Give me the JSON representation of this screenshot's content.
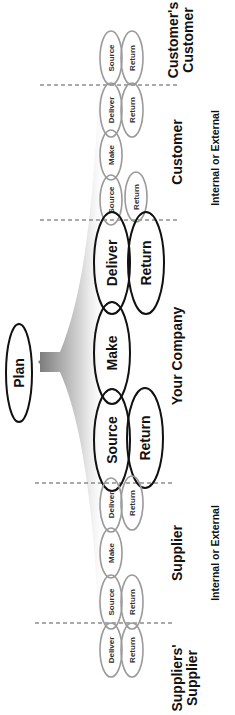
{
  "diagram": {
    "orientation": "rotated -90deg (read bottom-to-top)",
    "plan": {
      "label": "Plan"
    },
    "regions": [
      {
        "id": "suppliers_supplier",
        "title_line1": "Suppliers'",
        "title_line2": "Supplier",
        "subtitle": ""
      },
      {
        "id": "supplier",
        "title_line1": "Supplier",
        "title_line2": "",
        "subtitle": "Internal or External"
      },
      {
        "id": "your_company",
        "title_line1": "Your Company",
        "title_line2": "",
        "subtitle": ""
      },
      {
        "id": "customer",
        "title_line1": "Customer",
        "title_line2": "",
        "subtitle": "Internal or External"
      },
      {
        "id": "customers_customer",
        "title_line1": "Customer's",
        "title_line2": "Customer",
        "subtitle": ""
      }
    ],
    "processes": {
      "suppliers_supplier": {
        "deliver": "Deliver",
        "return": "Return"
      },
      "supplier": {
        "source": "Source",
        "make": "Make",
        "deliver": "Deliver",
        "return_in": "Return",
        "return_out": "Return"
      },
      "your_company": {
        "source": "Source",
        "make": "Make",
        "deliver": "Deliver",
        "return_in": "Return",
        "return_out": "Return"
      },
      "customer": {
        "source": "Source",
        "make": "Make",
        "deliver": "Deliver",
        "return_in": "Return",
        "return_out": "Return"
      },
      "customers_customer": {
        "source": "Source",
        "return": "Return"
      }
    },
    "colors": {
      "partner_outline": "#9a9a9a",
      "company_outline": "#111111",
      "plan_arrow": "#6e6e6e",
      "divider": "#555555"
    }
  }
}
